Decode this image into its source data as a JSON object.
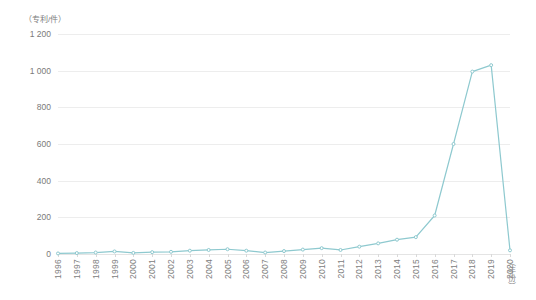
{
  "chart_data": {
    "type": "line",
    "title": "",
    "subtitle": "",
    "ylabel": "（专利/件）",
    "xlabel": "（年份）",
    "categories": [
      "1996",
      "1997",
      "1998",
      "1999",
      "2000",
      "2001",
      "2002",
      "2003",
      "2004",
      "2005",
      "2006",
      "2007",
      "2008",
      "2009",
      "2010",
      "2011",
      "2012",
      "2013",
      "2014",
      "2015",
      "2016",
      "2017",
      "2018",
      "2019",
      "2020"
    ],
    "values": [
      3,
      5,
      8,
      14,
      6,
      10,
      12,
      18,
      22,
      26,
      18,
      8,
      16,
      24,
      32,
      22,
      40,
      58,
      78,
      92,
      210,
      600,
      995,
      1030,
      20
    ],
    "series": [
      {
        "name": "专利数量",
        "values": [
          3,
          5,
          8,
          14,
          6,
          10,
          12,
          18,
          22,
          26,
          18,
          8,
          16,
          24,
          32,
          22,
          40,
          58,
          78,
          92,
          210,
          600,
          995,
          1030,
          20
        ]
      }
    ],
    "ylim": [
      0,
      1200
    ],
    "y_ticks": [
      0,
      200,
      400,
      600,
      800,
      1000,
      1200
    ],
    "y_tick_labels": [
      "0",
      "200",
      "400",
      "600",
      "800",
      "1 000",
      "1 200"
    ],
    "grid": true,
    "legend": false,
    "legend_position": "none",
    "line_color": "#8ec9cf",
    "grid_color": "#ededed",
    "text_color": "#808080",
    "background": "#ffffff",
    "markers": true
  }
}
